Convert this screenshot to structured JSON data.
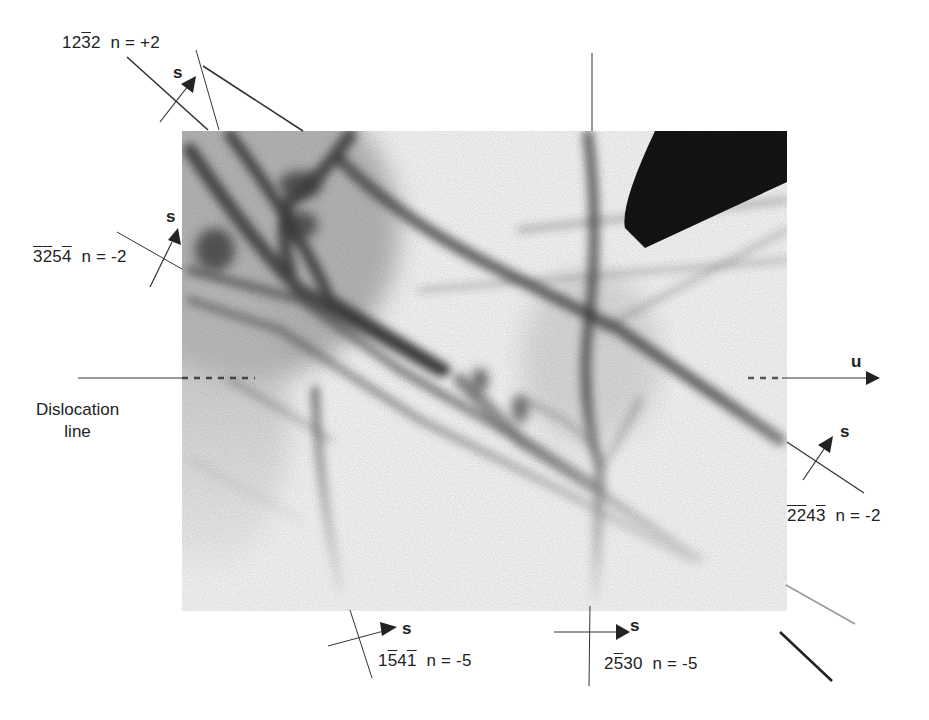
{
  "figure": {
    "type": "annotated-electron-micrograph",
    "colors": {
      "ink": "#222222",
      "micrograph_band": "#555555",
      "background": "#ffffff"
    },
    "dislocation_line_label": [
      "Dislocation",
      "line"
    ],
    "u_label": "u",
    "s_label": "s",
    "reflections": [
      {
        "id": "r1",
        "digits": [
          {
            "d": "1",
            "bar": false
          },
          {
            "d": "2",
            "bar": false
          },
          {
            "d": "3",
            "bar": true
          },
          {
            "d": "2",
            "bar": false
          }
        ],
        "n": "n = +2"
      },
      {
        "id": "r2",
        "digits": [
          {
            "d": "3",
            "bar": true
          },
          {
            "d": "2",
            "bar": true
          },
          {
            "d": "5",
            "bar": false
          },
          {
            "d": "4",
            "bar": true
          }
        ],
        "n": "n = -2"
      },
      {
        "id": "r3",
        "digits": [
          {
            "d": "2",
            "bar": true
          },
          {
            "d": "2",
            "bar": true
          },
          {
            "d": "4",
            "bar": false
          },
          {
            "d": "3",
            "bar": true
          }
        ],
        "n": "n = -2"
      },
      {
        "id": "r4",
        "digits": [
          {
            "d": "1",
            "bar": false
          },
          {
            "d": "5",
            "bar": true
          },
          {
            "d": "4",
            "bar": false
          },
          {
            "d": "1",
            "bar": true
          }
        ],
        "n": "n = -5"
      },
      {
        "id": "r5",
        "digits": [
          {
            "d": "2",
            "bar": false
          },
          {
            "d": "5",
            "bar": true
          },
          {
            "d": "3",
            "bar": false
          },
          {
            "d": "0",
            "bar": false
          }
        ],
        "n": "n = -5"
      }
    ]
  }
}
